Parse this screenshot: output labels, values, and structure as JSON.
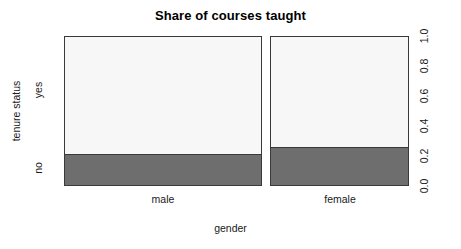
{
  "chart_data": {
    "type": "bar",
    "subtype": "spineplot",
    "title": "Share of courses taught",
    "xlabel": "gender",
    "ylabel": "tenure status",
    "categories": [
      "male",
      "female"
    ],
    "response_levels": [
      "no",
      "yes"
    ],
    "series": [
      {
        "name": "no",
        "values": [
          0.21,
          0.26
        ]
      },
      {
        "name": "yes",
        "values": [
          0.79,
          0.74
        ]
      }
    ],
    "right_axis_ticks": [
      "0.0",
      "0.2",
      "0.4",
      "0.6",
      "0.8",
      "1.0"
    ],
    "right_axis_values": [
      0.0,
      0.2,
      0.4,
      0.6,
      0.8,
      1.0
    ],
    "ylim": [
      0,
      1
    ],
    "grid": false,
    "legend": "none",
    "colors": {
      "fill_yes": "#f7f7f7",
      "fill_no": "#6e6e6e",
      "border": "#3a3a3a",
      "text": "#1a1a1a",
      "background": "#ffffff"
    },
    "bar_widths": [
      0.57,
      0.4
    ]
  },
  "axes": {
    "y_category_labels": [
      "yes",
      "no"
    ],
    "x_category_labels": [
      "male",
      "female"
    ],
    "y_title": "tenure status",
    "x_title": "gender"
  }
}
